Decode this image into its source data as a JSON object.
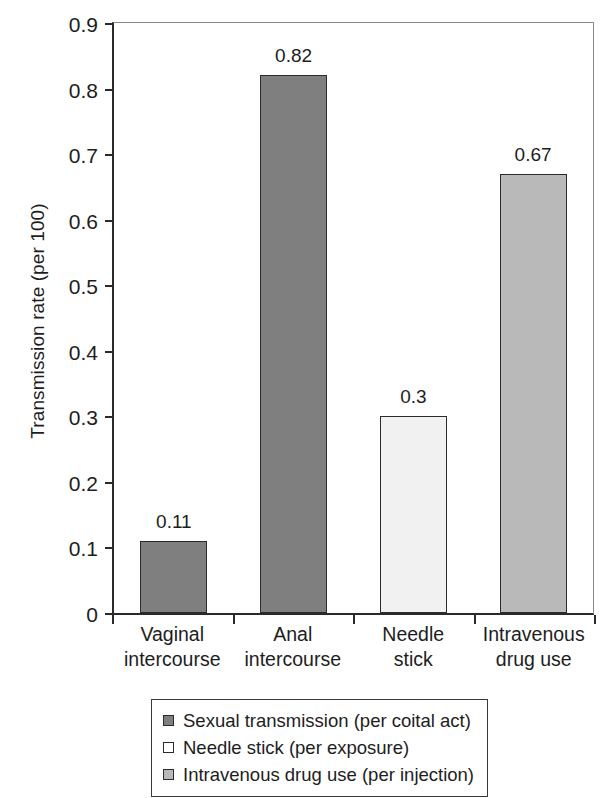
{
  "chart_data": {
    "type": "bar",
    "title": "",
    "xlabel": "",
    "ylabel": "Transmission rate (per 100)",
    "ylim": [
      0,
      0.9
    ],
    "ytick_labels": [
      "0.9",
      "0.8",
      "0.7",
      "0.6",
      "0.5",
      "0.4",
      "0.3",
      "0.2",
      "0.1",
      "0"
    ],
    "ytick_values": [
      0.9,
      0.8,
      0.7,
      0.6,
      0.5,
      0.4,
      0.3,
      0.2,
      0.1,
      0
    ],
    "grid": false,
    "legend_position": "bottom",
    "categories": [
      "Vaginal intercourse",
      "Anal intercourse",
      "Needle stick",
      "Intravenous drug use"
    ],
    "category_lines": [
      [
        "Vaginal",
        "intercourse"
      ],
      [
        "Anal",
        "intercourse"
      ],
      [
        "Needle",
        "stick"
      ],
      [
        "Intravenous",
        "drug use"
      ]
    ],
    "values": [
      0.11,
      0.82,
      0.3,
      0.67
    ],
    "value_labels": [
      "0.11",
      "0.82",
      "0.3",
      "0.67"
    ],
    "bar_colors": [
      "#7f7f7f",
      "#7f7f7f",
      "#f1f1f1",
      "#b9b9b9"
    ],
    "bar_series": [
      "Sexual transmission (per coital act)",
      "Sexual transmission (per coital act)",
      "Needle stick (per exposure)",
      "Intravenous drug use (per injection)"
    ],
    "legend": [
      {
        "label": "Sexual transmission (per coital act)",
        "color": "#7f7f7f"
      },
      {
        "label": "Needle stick (per exposure)",
        "color": "#ffffff"
      },
      {
        "label": "Intravenous drug use (per injection)",
        "color": "#b9b9b9"
      }
    ]
  }
}
